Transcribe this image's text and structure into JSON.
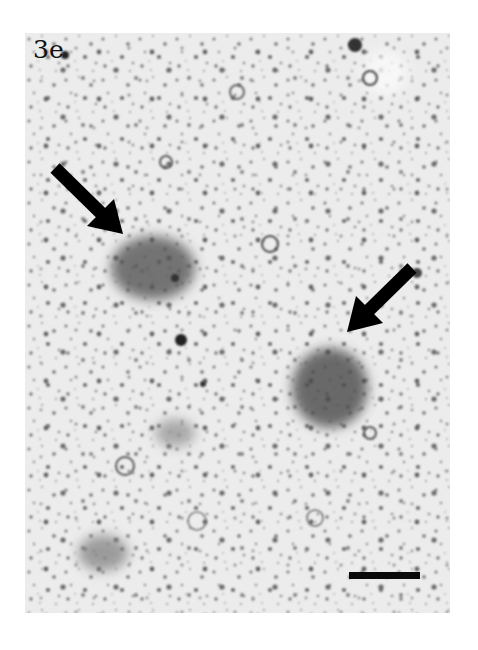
{
  "figure": {
    "panel_label": "3e",
    "type": "micrograph",
    "colors": {
      "background": "#e9e9e9",
      "stain": "#2a2a2a",
      "arrow": "#000000",
      "scale_bar": "#0a0a0a"
    },
    "annotations": {
      "arrows": [
        {
          "name": "arrow-upper-left",
          "tail": [
            30,
            135
          ],
          "tip": [
            98,
            201
          ],
          "points_to": "stained cell cluster (upper left)"
        },
        {
          "name": "arrow-right",
          "tail": [
            387,
            235
          ],
          "tip": [
            322,
            299
          ],
          "points_to": "stained cell cluster (right)"
        }
      ],
      "scale_bar": {
        "x": 324,
        "y": 539,
        "width": 71,
        "height": 7
      }
    }
  }
}
